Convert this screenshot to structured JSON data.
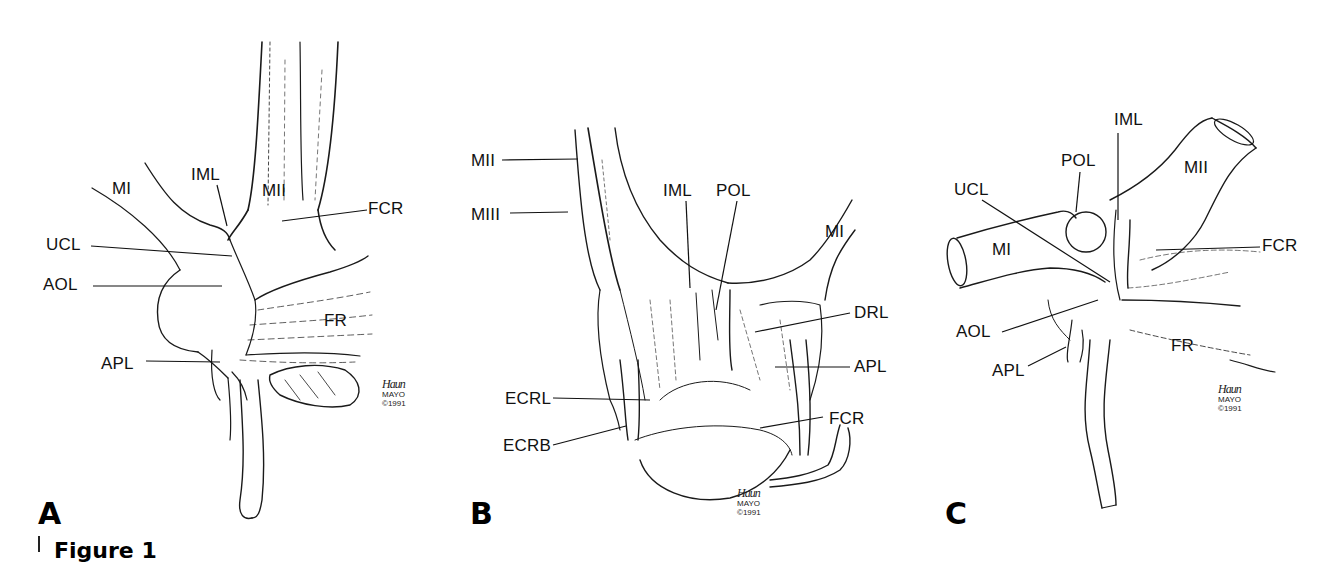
{
  "figure": {
    "caption_label": "Figure 1",
    "panels": [
      {
        "letter": "A",
        "labels": {
          "MI": "MI",
          "IML": "IML",
          "MII": "MII",
          "FCR": "FCR",
          "UCL": "UCL",
          "AOL": "AOL",
          "FR": "FR",
          "APL": "APL"
        },
        "signature": {
          "scrawl": "Haun",
          "org": "MAYO",
          "copyright": "©1991"
        }
      },
      {
        "letter": "B",
        "labels": {
          "MII": "MII",
          "MIII": "MIII",
          "IML": "IML",
          "POL": "POL",
          "MI": "MI",
          "DRL": "DRL",
          "APL": "APL",
          "ECRL": "ECRL",
          "ECRB": "ECRB",
          "FCR": "FCR"
        },
        "signature": {
          "scrawl": "Haun",
          "org": "MAYO",
          "copyright": "©1991"
        }
      },
      {
        "letter": "C",
        "labels": {
          "IML": "IML",
          "POL": "POL",
          "MII": "MII",
          "UCL": "UCL",
          "MI": "MI",
          "FCR": "FCR",
          "AOL": "AOL",
          "FR": "FR",
          "APL": "APL"
        },
        "signature": {
          "scrawl": "Haun",
          "org": "MAYO",
          "copyright": "©1991"
        }
      }
    ]
  }
}
